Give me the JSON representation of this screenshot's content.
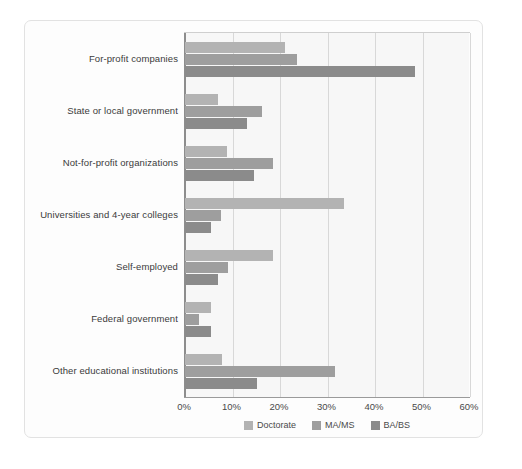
{
  "chart_data": {
    "type": "bar",
    "orientation": "horizontal",
    "title": "",
    "subtitle": "",
    "xlabel": "",
    "ylabel": "",
    "xlim": [
      0,
      60
    ],
    "xticks": [
      0,
      10,
      20,
      30,
      40,
      50,
      60
    ],
    "xtick_labels": [
      "0%",
      "10%",
      "20%",
      "30%",
      "40%",
      "50%",
      "60%"
    ],
    "grid": "vertical",
    "legend_position": "bottom-center",
    "categories": [
      "For-profit companies",
      "State or local government",
      "Not-for-profit organizations",
      "Universities and 4-year colleges",
      "Self-employed",
      "Federal government",
      "Other educational institutions"
    ],
    "series": [
      {
        "name": "Doctorate",
        "color": "#b3b3b3",
        "values": [
          21.0,
          7.0,
          8.8,
          33.5,
          18.5,
          5.5,
          7.8
        ]
      },
      {
        "name": "MA/MS",
        "color": "#9e9e9e",
        "values": [
          23.5,
          16.3,
          18.5,
          7.5,
          9.0,
          3.0,
          31.5
        ]
      },
      {
        "name": "BA/BS",
        "color": "#8b8b8b",
        "values": [
          48.5,
          13.0,
          14.5,
          5.5,
          7.0,
          5.5,
          15.2
        ]
      }
    ]
  },
  "legend": {
    "items": [
      {
        "label": "Doctorate"
      },
      {
        "label": "MA/MS"
      },
      {
        "label": "BA/BS"
      }
    ]
  }
}
